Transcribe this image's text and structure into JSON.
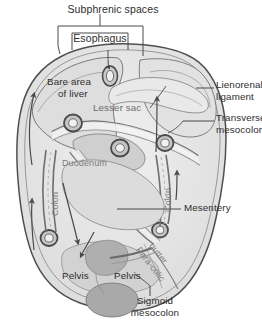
{
  "figure": {
    "type": "anatomical-diagram",
    "style": "grayscale line illustration with shaded regions",
    "background_color": "#ffffff",
    "ink_color": "#2e2e2e",
    "fill_light": "#e8e8e8",
    "fill_mid": "#d4d4d4",
    "fill_dark": "#b3b3b3",
    "fill_darkest": "#9a9a9a"
  },
  "labels": {
    "subphrenic_spaces": "Subphrenic spaces",
    "esophagus": "Esophagus",
    "bare_area_line1": "Bare area",
    "bare_area_line2": "of liver",
    "lesser_sac": "Lesser sac",
    "lienorenal_line1": "Lienorenal",
    "lienorenal_line2": "ligament",
    "transverse_line1": "Transverse",
    "transverse_line2": "mesocolon",
    "duodenum": "Duodenum",
    "colon_left": "Colon",
    "colon_right": "Colon",
    "mesentery": "Mesentery",
    "paracolic_line1": "Para-colic",
    "paracolic_line2": "gutter",
    "pelvis_left": "Pelvis",
    "pelvis_right": "Pelvis",
    "sigmoid_line1": "Sigmoid",
    "sigmoid_line2": "mesocolon"
  },
  "annotations": {
    "bracket": "subphrenic-spaces-bracket",
    "box": "esophagus-callout-box",
    "arrows": [
      "left-upper-flow-arrow",
      "left-lower-flow-arrow",
      "right-upper-flow-arrow",
      "right-lower-flow-arrow",
      "central-descending-arrow",
      "central-curved-arrow"
    ],
    "leader_lines": [
      "esophagus-leader",
      "lesser-sac-leader",
      "lienorenal-leader",
      "transverse-mesocolon-leader",
      "mesentery-leader",
      "sigmoid-mesocolon-leader"
    ]
  }
}
